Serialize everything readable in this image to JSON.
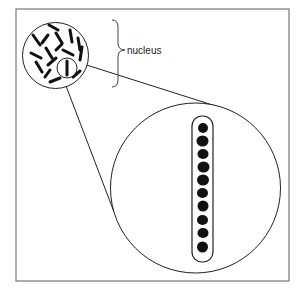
{
  "diagram": {
    "label": "nucleus",
    "colors": {
      "frame": "#777777",
      "stroke": "#222222",
      "fill": "#111111",
      "background": "#ffffff"
    },
    "elements": {
      "frame": "rectangular border",
      "nucleus": "circle containing rod-shaped chromosomes",
      "highlight_circle": "small circle around one chromosome",
      "magnified_view": "large circle showing a chromosome with 10 dark beads in a capsule outline",
      "bead_count": 10
    }
  }
}
